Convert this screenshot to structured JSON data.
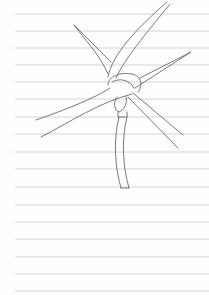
{
  "image": {
    "subject": "pencil sketch of a windmill on lined paper",
    "paper_color": "#fefefe",
    "line_color": "#d4d4d4",
    "ink_color": "#6a6a6a",
    "ruled_lines": {
      "count": 17,
      "start_y": 14,
      "spacing": 17.3,
      "start_x": 15,
      "end_x": 209
    }
  }
}
